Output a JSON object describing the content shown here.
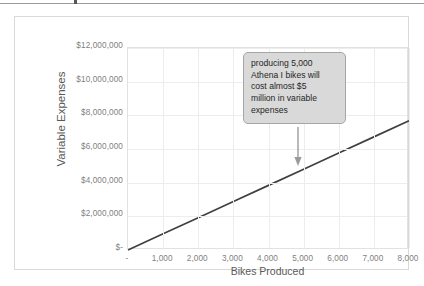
{
  "figure": {
    "background_color": "#ffffff",
    "border_color": "#d9d9d9",
    "rule_color": "#9c9c9c"
  },
  "chart_data": {
    "type": "line",
    "title": "",
    "xlabel": "Bikes Produced",
    "ylabel": "Variable Expenses",
    "xlim": [
      0,
      8000
    ],
    "ylim": [
      0,
      12000000
    ],
    "grid": true,
    "legend": "none",
    "line_color": "#404040",
    "x_tick_labels": [
      "-",
      "1,000",
      "2,000",
      "3,000",
      "4,000",
      "5,000",
      "6,000",
      "7,000",
      "8,000"
    ],
    "x_ticks": [
      0,
      1000,
      2000,
      3000,
      4000,
      5000,
      6000,
      7000,
      8000
    ],
    "y_tick_labels": [
      "$12,000,000",
      "$10,000,000",
      "$8,000,000",
      "$6,000,000",
      "$4,000,000",
      "$2,000,000",
      "$-"
    ],
    "y_ticks": [
      12000000,
      10000000,
      8000000,
      6000000,
      4000000,
      2000000,
      0
    ],
    "series": [
      {
        "name": "Variable Expenses",
        "x": [
          0,
          1000,
          2000,
          3000,
          4000,
          5000,
          6000,
          7000,
          8000
        ],
        "values": [
          0,
          960000,
          1920000,
          2880000,
          3840000,
          4800000,
          5760000,
          6720000,
          7680000
        ]
      }
    ],
    "annotations": [
      {
        "kind": "callout-box",
        "lines": [
          "producing 5,000",
          "Athena I bikes will",
          "cost almost $5",
          "million in variable",
          "expenses"
        ],
        "fill_color": "#d9d9d9",
        "border_color": "#a6a6a6",
        "arrow_points_to": {
          "x": 5000,
          "y": 4800000
        }
      }
    ]
  }
}
